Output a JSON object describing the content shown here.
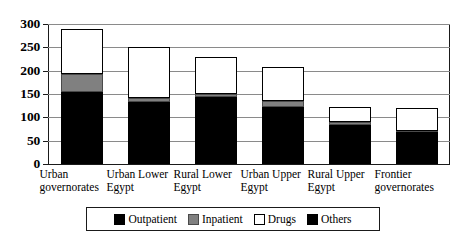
{
  "chart_data": {
    "type": "bar",
    "subtype": "stacked",
    "title": "",
    "xlabel": "",
    "ylabel": "",
    "ylim": [
      0,
      300
    ],
    "ytick_values": [
      0,
      50,
      100,
      150,
      200,
      250,
      300
    ],
    "ytick_labels": [
      "0",
      "50",
      "100",
      "150",
      "200",
      "250",
      "300"
    ],
    "grid": true,
    "legend_position": "bottom",
    "categories": [
      "Urban governorates",
      "Urban Lower Egypt",
      "Rural Lower Egypt",
      "Urban Upper Egypt",
      "Rural Upper Egypt",
      "Frontier governorates"
    ],
    "category_lines": [
      [
        "Urban",
        "governorates"
      ],
      [
        "Urban Lower",
        "Egypt"
      ],
      [
        "Rural Lower",
        "Egypt"
      ],
      [
        "Urban Upper",
        "Egypt"
      ],
      [
        "Rural Upper",
        "Egypt"
      ],
      [
        "Frontier",
        "governorates"
      ]
    ],
    "series": [
      {
        "name": "Outpatient",
        "color": "#000000",
        "values": [
          155,
          132,
          143,
          122,
          84,
          68
        ]
      },
      {
        "name": "Inpatient",
        "color": "#808080",
        "values": [
          38,
          10,
          7,
          13,
          6,
          3
        ]
      },
      {
        "name": "Drugs",
        "color": "#ffffff",
        "values": [
          97,
          108,
          80,
          73,
          33,
          49
        ]
      },
      {
        "name": "Others",
        "color": "#000000",
        "values": [
          0,
          0,
          0,
          0,
          0,
          0
        ]
      }
    ],
    "totals": [
      290,
      250,
      230,
      208,
      123,
      120
    ],
    "legend_entries": [
      "Outpatient",
      "Inpatient",
      "Drugs",
      "Others"
    ]
  }
}
